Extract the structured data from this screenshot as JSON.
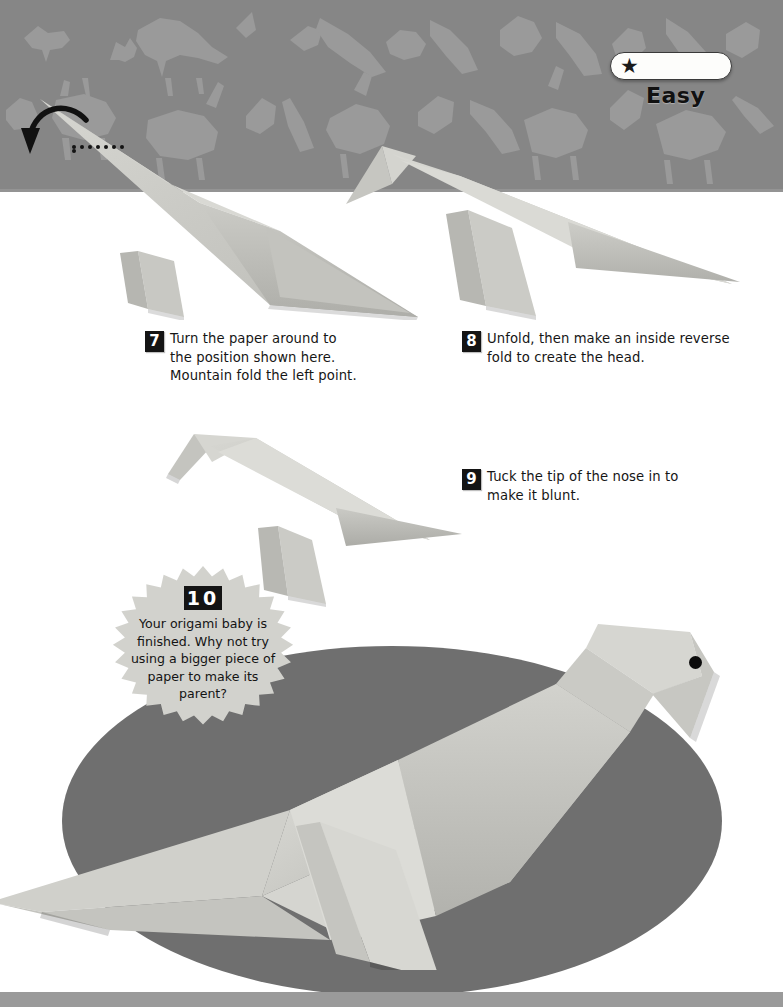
{
  "page": {
    "background_color": "#ffffff",
    "header_band_color": "#868686",
    "bottom_strip_color": "#9a9a9a",
    "paper_color": "#c9c9c4",
    "paper_shadow_color": "#a9a9a4",
    "oval_color": "#6f6f6f",
    "ink_color": "#141414"
  },
  "difficulty": {
    "star_glyph": "★",
    "star_count": 1,
    "label": "Easy"
  },
  "annotations": {
    "fold_arrow_name": "mountain-fold-arrow",
    "dotted_line_dots": 8
  },
  "steps": [
    {
      "number": "7",
      "text": "Turn the paper around to the position shown here. Mountain fold the left point."
    },
    {
      "number": "8",
      "text": "Unfold, then make an inside reverse fold to create the head."
    },
    {
      "number": "9",
      "text": "Tuck the tip of the nose in to make it blunt."
    }
  ],
  "final_step": {
    "number": "10",
    "text": "Your origami baby is finished. Why not try using a bigger piece of paper to make its parent?"
  },
  "models": [
    {
      "name": "origami-model-step-7",
      "caption_step": "7"
    },
    {
      "name": "origami-model-step-8",
      "caption_step": "8"
    },
    {
      "name": "origami-model-step-9",
      "caption_step": "9"
    },
    {
      "name": "origami-model-finished-bird",
      "caption_step": "10"
    }
  ]
}
